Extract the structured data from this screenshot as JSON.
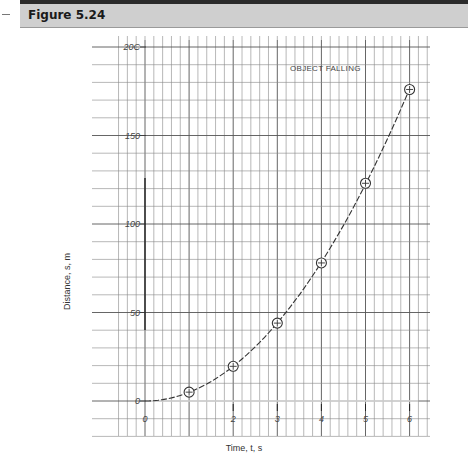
{
  "header": {
    "title": "Figure 5.24"
  },
  "chart_data": {
    "type": "line",
    "title": "OBJECT FALLING",
    "xlabel": "Time, t, s",
    "ylabel": "Distance, s, m",
    "x": [
      0,
      1,
      2,
      3,
      4,
      5,
      6
    ],
    "series": [
      {
        "name": "Distance",
        "values": [
          0,
          5,
          19.6,
          44,
          78,
          123,
          176
        ]
      }
    ],
    "markers": "circled-plus at t=1..6",
    "x_ticks": [
      "0",
      "1",
      "2",
      "3",
      "4",
      "5",
      "6"
    ],
    "y_ticks": [
      "0",
      "50",
      "100",
      "150",
      "200"
    ],
    "xlim": [
      -0.3,
      6.5
    ],
    "ylim": [
      -20,
      205
    ],
    "grid": true,
    "line_style": "dashed curve"
  },
  "labels": {
    "title": "OBJECT FALLING",
    "xlabel": "Time, t, s",
    "ylabel": "Distance, s, m",
    "x_ticks": [
      "0",
      "2",
      "3",
      "4",
      "5",
      "6"
    ],
    "y_ticks": [
      "0",
      "50",
      "100",
      "150",
      "200"
    ]
  }
}
